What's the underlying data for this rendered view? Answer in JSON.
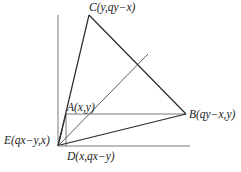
{
  "diagram": {
    "type": "geometry-figure",
    "colors": {
      "stroke": "#2a2a2a",
      "axis": "#555555",
      "text": "#222222"
    },
    "points": {
      "A": {
        "label": "A(x,y)",
        "px": [
          66,
          114
        ]
      },
      "B": {
        "label": "B(qy−x,y)",
        "px": [
          186,
          114
        ]
      },
      "C": {
        "label": "C(y,qy−x)",
        "px": [
          89,
          15
        ]
      },
      "D": {
        "label": "D(x,qx−y)",
        "px": [
          66,
          144
        ]
      },
      "E": {
        "label": "E(qx−y,x)",
        "px": [
          58,
          140
        ]
      }
    },
    "origin_px": [
      58,
      146
    ],
    "axes": {
      "y_axis": {
        "from": [
          58,
          146
        ],
        "to": [
          58,
          15
        ]
      },
      "x_axis": {
        "from": [
          58,
          146
        ],
        "to": [
          190,
          146
        ]
      }
    },
    "diagonal": {
      "from": [
        58,
        146
      ],
      "to": [
        148,
        54
      ]
    },
    "segments": [
      [
        "E",
        "C"
      ],
      [
        "C",
        "B"
      ],
      [
        "B",
        "D"
      ],
      [
        "A",
        "B"
      ],
      [
        "A",
        "D"
      ]
    ]
  }
}
